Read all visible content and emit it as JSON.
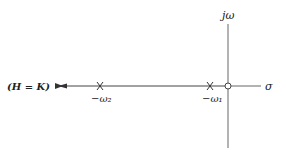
{
  "diagram": {
    "type": "s-plane root locus",
    "axes": {
      "imaginary_label": "jω",
      "real_label": "σ"
    },
    "poles": [
      {
        "label": "−ω₂",
        "x": 100
      },
      {
        "label": "−ω₁",
        "x": 210
      }
    ],
    "zero": {
      "label": "origin",
      "x": 228
    },
    "locus_end_label": "(H = K)",
    "colors": {
      "line": "#555555",
      "text": "#222222"
    }
  }
}
